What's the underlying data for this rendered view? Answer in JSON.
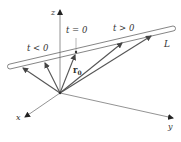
{
  "diagram": {
    "type": "vector-line-parametrization",
    "axes": {
      "z_label": "z",
      "x_label": "x",
      "y_label": "y"
    },
    "line_label": "L",
    "labels": {
      "t_neg": "t < 0",
      "t_zero": "t = 0",
      "t_pos": "t > 0",
      "r0_main": "r",
      "r0_sub": "0"
    },
    "colors": {
      "axis": "#777777",
      "vector": "#555555",
      "line": "#666666",
      "text": "#333333"
    },
    "vectors_count": 5
  }
}
